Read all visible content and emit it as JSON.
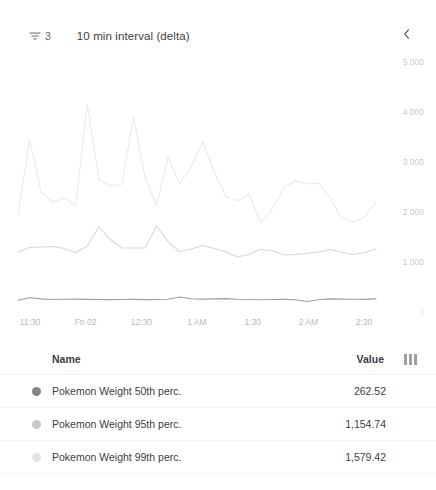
{
  "header": {
    "filter_icon": "tune-icon",
    "filter_count": "3",
    "interval_label": "10 min interval (delta)",
    "collapse_icon": "chevron-left-icon"
  },
  "legend": {
    "name_header": "Name",
    "value_header": "Value",
    "columns_icon": "view-columns-icon",
    "rows": [
      {
        "color": "#80868b",
        "name": "Pokemon Weight 50th perc.",
        "value": "262.52"
      },
      {
        "color": "#c5c8ca",
        "name": "Pokemon Weight 95th perc.",
        "value": "1,154.74"
      },
      {
        "color": "#e2e4e6",
        "name": "Pokemon Weight 99th perc.",
        "value": "1,579.42"
      }
    ]
  },
  "chart_data": {
    "type": "line",
    "title": "",
    "xlabel": "",
    "ylabel": "",
    "ylim": [
      0,
      5000
    ],
    "yticks": [
      0,
      1000,
      2000,
      3000,
      4000,
      5000
    ],
    "ytick_labels": [
      "0",
      "1 000",
      "2 000",
      "3 000",
      "4 000",
      "5 000"
    ],
    "xtick_labels": [
      "11:30",
      "Fri 02",
      "12:30",
      "1 AM",
      "1:30",
      "2 AM",
      "2:30"
    ],
    "grid": false,
    "legend_position": "below-table",
    "series": [
      {
        "name": "Pokemon Weight 99th perc.",
        "color": "#e8eaec",
        "values": [
          1950,
          3450,
          2400,
          2200,
          2280,
          2130,
          4150,
          2650,
          2530,
          2550,
          3900,
          2700,
          2130,
          3100,
          2560,
          2900,
          3400,
          2800,
          2310,
          2220,
          2350,
          1790,
          2050,
          2480,
          2620,
          2560,
          2580,
          2300,
          1880,
          1800,
          1900,
          2200
        ]
      },
      {
        "name": "Pokemon Weight 95th perc.",
        "color": "#d4d7d9",
        "values": [
          1200,
          1290,
          1300,
          1310,
          1270,
          1190,
          1320,
          1700,
          1450,
          1280,
          1280,
          1280,
          1720,
          1400,
          1210,
          1260,
          1330,
          1270,
          1200,
          1100,
          1150,
          1250,
          1230,
          1140,
          1150,
          1170,
          1200,
          1250,
          1200,
          1150,
          1190,
          1260
        ]
      },
      {
        "name": "Pokemon Weight 50th perc.",
        "color": "#9aa0a6",
        "values": [
          235,
          285,
          262,
          250,
          255,
          258,
          252,
          250,
          248,
          250,
          252,
          248,
          250,
          255,
          300,
          265,
          258,
          262,
          268,
          255,
          250,
          245,
          250,
          252,
          245,
          210,
          245,
          262,
          258,
          255,
          252,
          262
        ]
      }
    ]
  }
}
